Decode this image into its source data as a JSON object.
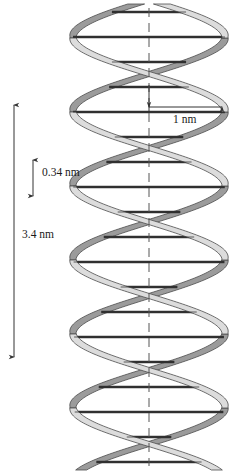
{
  "figure": {
    "background_color": "#ffffff",
    "width": 236,
    "height": 474
  },
  "annotations": {
    "helix_diameter": {
      "label": "1 nm",
      "name": "helix-diameter",
      "orientation": "horizontal",
      "value": 1,
      "unit": "nm"
    },
    "base_pair_rise": {
      "label": "0.34 nm",
      "name": "base-pair-rise",
      "orientation": "vertical",
      "value": 0.34,
      "unit": "nm"
    },
    "helix_pitch": {
      "label": "3.4 nm",
      "name": "helix-pitch",
      "orientation": "vertical",
      "value": 3.4,
      "unit": "nm"
    }
  },
  "colors": {
    "stroke": "#1a1a1a",
    "ribbon_front": "#dcdcdc",
    "ribbon_back": "#9b9b9b",
    "ribbon_edge": "#4d4d4d",
    "rung": "#3a3a3a",
    "axis_line": "#555555",
    "background": "#ffffff"
  },
  "geometry": {
    "axis_x": 149,
    "helix_left": 73,
    "helix_right": 225,
    "helix_center_x": 149,
    "helix_radius": 76,
    "period": 148,
    "ribbon_width": 17,
    "phase_offset_deg": 180
  },
  "base_pair_rungs": {
    "count": 17,
    "y_positions": [
      12,
      37,
      62,
      87,
      112,
      137,
      162,
      187,
      212,
      237,
      262,
      287,
      312,
      337,
      362,
      387,
      412,
      437,
      462
    ]
  },
  "dimension_lines": {
    "vertical_pitch": {
      "x": 14,
      "y_top": 105,
      "y_bottom": 357
    },
    "vertical_rise": {
      "x": 33,
      "y_top": 160,
      "y_bottom": 196
    },
    "horizontal_diameter": {
      "y": 107,
      "x_left": 149,
      "x_right": 222
    },
    "center_dashed": {
      "x": 149,
      "y_top": 8,
      "y_bottom": 466
    }
  }
}
